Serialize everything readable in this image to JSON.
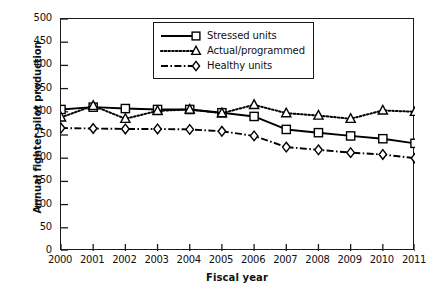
{
  "chart_data": {
    "type": "line",
    "title": "",
    "xlabel": "Fiscal year",
    "ylabel": "Annual fighter pilot production",
    "x": [
      2000,
      2001,
      2002,
      2003,
      2004,
      2005,
      2006,
      2007,
      2008,
      2009,
      2010,
      2011
    ],
    "categories": [
      "2000",
      "2001",
      "2002",
      "2003",
      "2004",
      "2005",
      "2006",
      "2007",
      "2008",
      "2009",
      "2010",
      "2011"
    ],
    "xlim": [
      2000,
      2011
    ],
    "ylim": [
      0,
      500
    ],
    "yticks": [
      0,
      50,
      100,
      150,
      200,
      250,
      300,
      350,
      400,
      450,
      500
    ],
    "ytick_labels": [
      "0",
      "50",
      "100",
      "150",
      "200",
      "250",
      "300",
      "350",
      "400",
      "450",
      "500"
    ],
    "grid": false,
    "legend_position": "top-center",
    "series": [
      {
        "name": "Stressed units",
        "marker": "square",
        "linestyle": "solid",
        "color": "#000000",
        "values": [
          305,
          310,
          307,
          305,
          305,
          298,
          290,
          262,
          255,
          248,
          242,
          232
        ]
      },
      {
        "name": "Actual/programmed",
        "marker": "triangle",
        "linestyle": "dotted",
        "color": "#000000",
        "values": [
          288,
          313,
          285,
          302,
          305,
          297,
          315,
          297,
          292,
          285,
          303,
          300
        ]
      },
      {
        "name": "Healthy units",
        "marker": "diamond",
        "linestyle": "dashdot",
        "color": "#000000",
        "values": [
          265,
          264,
          263,
          263,
          262,
          258,
          248,
          224,
          218,
          212,
          208,
          200
        ]
      }
    ]
  },
  "axis": {
    "x_title": "Fiscal year",
    "y_title": "Annual fighter pilot production"
  },
  "legend": {
    "items": [
      {
        "label": "Stressed units"
      },
      {
        "label": "Actual/programmed"
      },
      {
        "label": "Healthy units"
      }
    ]
  }
}
